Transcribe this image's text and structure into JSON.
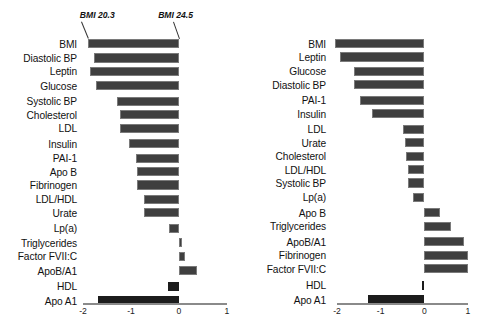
{
  "figure": {
    "background": "#ffffff",
    "bar_color": "#3f3f3f",
    "bar_dark_color": "#1c1c1c",
    "axis_color": "#8a8a8a"
  },
  "chart_data": [
    {
      "type": "bar",
      "orientation": "horizontal",
      "panel": "left",
      "title": "",
      "xlabel": "",
      "ylabel": "",
      "xlim": [
        -2,
        1
      ],
      "xticks": [
        -2,
        -1,
        0,
        1
      ],
      "xticklabels": [
        "-2",
        "-1",
        "0",
        "1"
      ],
      "grid": false,
      "legend": null,
      "annotations": [
        {
          "text": "BMI 20.3",
          "target_category": "BMI",
          "target_side": "left"
        },
        {
          "text": "BMI 24.5",
          "target_category": "BMI",
          "target_side": "right"
        }
      ],
      "categories": [
        "BMI",
        "Diastolic BP",
        "Leptin",
        "Glucose",
        "Systolic BP",
        "Cholesterol",
        "LDL",
        "Insulin",
        "PAI-1",
        "Apo B",
        "Fibrinogen",
        "LDL/HDL",
        "Urate",
        "Lp(a)",
        "Triglycerides",
        "Factor FVII:C",
        "ApoB/A1",
        "HDL",
        "Apo A1"
      ],
      "values": [
        -1.9,
        -1.78,
        -1.85,
        -1.72,
        -1.3,
        -1.23,
        -1.22,
        -1.05,
        -0.9,
        -0.87,
        -0.87,
        -0.73,
        -0.73,
        -0.21,
        0.06,
        0.12,
        0.38,
        -0.23,
        -1.68
      ],
      "dark_bars": [
        "HDL",
        "Apo A1"
      ]
    },
    {
      "type": "bar",
      "orientation": "horizontal",
      "panel": "right",
      "title": "",
      "xlabel": "",
      "ylabel": "",
      "xlim": [
        -2,
        1
      ],
      "xticks": [
        -2,
        -1,
        0,
        1
      ],
      "xticklabels": [
        "-2",
        "-1",
        "0",
        "1"
      ],
      "grid": false,
      "legend": null,
      "annotations": [],
      "categories": [
        "BMI",
        "Leptin",
        "Glucose",
        "Diastolic BP",
        "PAI-1",
        "Insulin",
        "LDL",
        "Urate",
        "Cholesterol",
        "LDL/HDL",
        "Systolic BP",
        "Lp(a)",
        "Apo B",
        "Triglycerides",
        "ApoB/A1",
        "Fibrinogen",
        "Factor FVII:C",
        "HDL",
        "Apo A1"
      ],
      "values": [
        -2.05,
        -1.92,
        -1.6,
        -1.6,
        -1.48,
        -1.2,
        -0.5,
        -0.45,
        -0.42,
        -0.38,
        -0.38,
        -0.25,
        0.35,
        0.6,
        0.9,
        1.0,
        1.0,
        -0.05,
        -1.28
      ],
      "dark_bars": [
        "HDL",
        "Apo A1"
      ]
    }
  ]
}
